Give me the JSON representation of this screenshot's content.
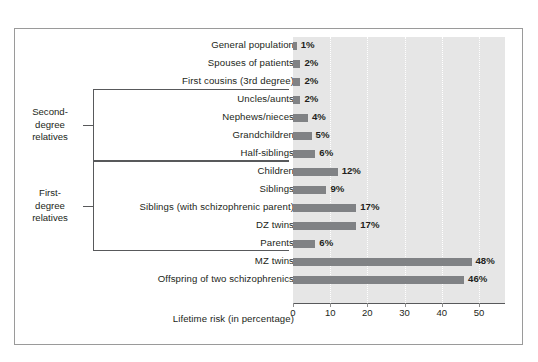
{
  "chart_data": {
    "type": "bar",
    "orientation": "horizontal",
    "title": "",
    "xlabel": "Lifetime risk (in percentage)",
    "ylabel": "",
    "xlim": [
      0,
      57
    ],
    "xticks": [
      0,
      10,
      20,
      30,
      40,
      50
    ],
    "grid": true,
    "legend": "none",
    "bar_color": "#808285",
    "plot_background": "#e6e6e6",
    "categories": [
      "General population",
      "Spouses of patients",
      "First cousins (3rd degree)",
      "Uncles/aunts",
      "Nephews/nieces",
      "Grandchildren",
      "Half-siblings",
      "Children",
      "Siblings",
      "Siblings (with schizophrenic parent)",
      "DZ twins",
      "Parents",
      "MZ twins",
      "Offspring of two schizophrenics"
    ],
    "values": [
      1,
      2,
      2,
      2,
      4,
      5,
      6,
      12,
      9,
      17,
      17,
      6,
      48,
      46
    ],
    "value_labels": [
      "1%",
      "2%",
      "2%",
      "2%",
      "4%",
      "5%",
      "6%",
      "12%",
      "9%",
      "17%",
      "17%",
      "6%",
      "48%",
      "46%"
    ],
    "annotations": [
      {
        "label": "Second-degree relatives",
        "label_lines": [
          "Second-",
          "degree",
          "relatives"
        ],
        "covers": [
          "Uncles/aunts",
          "Nephews/nieces",
          "Grandchildren",
          "Half-siblings"
        ]
      },
      {
        "label": "First-degree relatives",
        "label_lines": [
          "First-",
          "degree",
          "relatives"
        ],
        "covers": [
          "Children",
          "Siblings",
          "Siblings (with schizophrenic parent)",
          "DZ twins",
          "Parents"
        ]
      }
    ]
  }
}
